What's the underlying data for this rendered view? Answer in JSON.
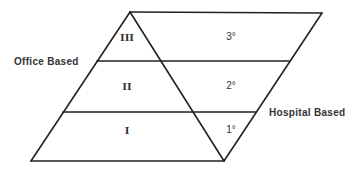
{
  "diagram": {
    "labels": {
      "office_based": "Office Based",
      "hospital_based": "Hospital Based"
    },
    "triangle_levels": [
      {
        "label": "III"
      },
      {
        "label": "II"
      },
      {
        "label": "I"
      }
    ],
    "parallelogram_levels": [
      {
        "label": "3°"
      },
      {
        "label": "2°"
      },
      {
        "label": "1°"
      }
    ],
    "colors": {
      "line": "#222222",
      "text": "#333333",
      "background": "#ffffff"
    }
  }
}
